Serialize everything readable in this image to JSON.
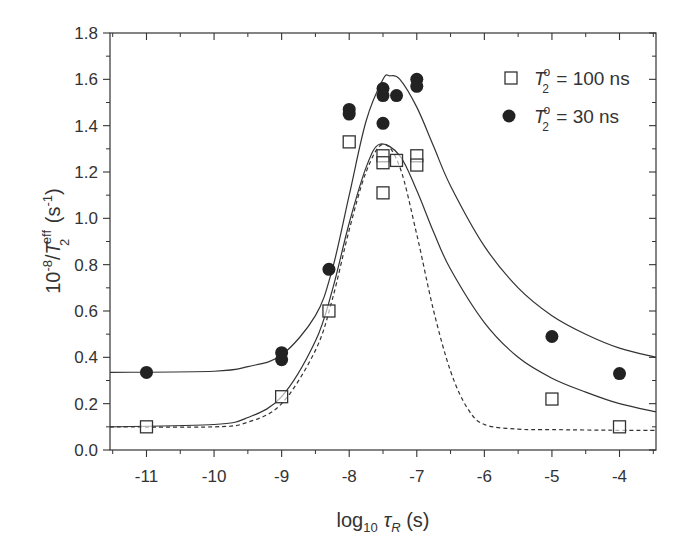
{
  "chart_data": {
    "type": "scatter",
    "title": "",
    "xlabel": "log10 τR (s)",
    "ylabel": "10^-8/T2^eff (s^-1)",
    "xlim": [
      -11.54,
      -3.46
    ],
    "ylim": [
      0.0,
      1.8
    ],
    "x_ticks": [
      -11,
      -10,
      -9,
      -8,
      -7,
      -6,
      -5,
      -4
    ],
    "y_ticks": [
      0.0,
      0.2,
      0.4,
      0.6,
      0.8,
      1.0,
      1.2,
      1.4,
      1.6,
      1.8
    ],
    "grid": false,
    "legend_position": "upper right",
    "series": [
      {
        "name": "T2° = 100 ns",
        "marker": "open-square",
        "points": [
          [
            -11,
            0.1
          ],
          [
            -9,
            0.23
          ],
          [
            -8.3,
            0.6
          ],
          [
            -8,
            1.33
          ],
          [
            -7.5,
            1.27
          ],
          [
            -7.5,
            1.24
          ],
          [
            -7.5,
            1.11
          ],
          [
            -7.3,
            1.25
          ],
          [
            -7,
            1.27
          ],
          [
            -7,
            1.23
          ],
          [
            -5,
            0.22
          ],
          [
            -4,
            0.1
          ]
        ]
      },
      {
        "name": "T2° = 30 ns",
        "marker": "filled-circle",
        "points": [
          [
            -11,
            0.335
          ],
          [
            -9,
            0.42
          ],
          [
            -9,
            0.39
          ],
          [
            -8.3,
            0.78
          ],
          [
            -8,
            1.47
          ],
          [
            -8,
            1.45
          ],
          [
            -7.5,
            1.56
          ],
          [
            -7.5,
            1.53
          ],
          [
            -7.5,
            1.41
          ],
          [
            -7.3,
            1.53
          ],
          [
            -7,
            1.6
          ],
          [
            -7,
            1.57
          ],
          [
            -5,
            0.49
          ],
          [
            -4,
            0.33
          ]
        ]
      }
    ],
    "curves": [
      {
        "name": "fit-30ns",
        "style": "solid",
        "baseline": 0.335,
        "peak": 1.615,
        "peak_x": -7.4,
        "x": [
          -11.54,
          -10,
          -9.5,
          -9,
          -8.5,
          -8.25,
          -8,
          -7.75,
          -7.5,
          -7.4,
          -7.25,
          -7,
          -6.75,
          -6.5,
          -6,
          -5.5,
          -5,
          -4.5,
          -4,
          -3.46
        ],
        "y": [
          0.335,
          0.34,
          0.36,
          0.41,
          0.58,
          0.78,
          1.1,
          1.42,
          1.6,
          1.615,
          1.6,
          1.48,
          1.31,
          1.14,
          0.88,
          0.7,
          0.58,
          0.5,
          0.44,
          0.4
        ]
      },
      {
        "name": "fit-100ns",
        "style": "solid",
        "baseline": 0.1,
        "peak": 1.32,
        "peak_x": -7.55,
        "x": [
          -11.54,
          -10,
          -9.5,
          -9,
          -8.5,
          -8.25,
          -8,
          -7.75,
          -7.55,
          -7.25,
          -7,
          -6.75,
          -6.5,
          -6,
          -5.5,
          -5,
          -4.5,
          -4,
          -3.46
        ],
        "y": [
          0.1,
          0.11,
          0.14,
          0.23,
          0.47,
          0.69,
          0.98,
          1.22,
          1.32,
          1.27,
          1.12,
          0.94,
          0.78,
          0.55,
          0.4,
          0.31,
          0.25,
          0.2,
          0.165
        ]
      },
      {
        "name": "fit-100ns-dashed",
        "style": "dashed",
        "baseline": 0.085,
        "peak": 1.32,
        "peak_x": -7.5,
        "x": [
          -11.54,
          -10,
          -9.5,
          -9,
          -8.5,
          -8.25,
          -8,
          -7.75,
          -7.5,
          -7.25,
          -7,
          -6.75,
          -6.5,
          -6.25,
          -6,
          -5.5,
          -5,
          -4,
          -3.46
        ],
        "y": [
          0.1,
          0.1,
          0.12,
          0.2,
          0.43,
          0.65,
          0.95,
          1.2,
          1.32,
          1.22,
          0.93,
          0.6,
          0.34,
          0.18,
          0.11,
          0.09,
          0.088,
          0.085,
          0.085
        ]
      }
    ]
  },
  "axes": {
    "x_tick_labels": [
      "-11",
      "-10",
      "-9",
      "-8",
      "-7",
      "-6",
      "-5",
      "-4"
    ],
    "y_tick_labels": [
      "0.0",
      "0.2",
      "0.4",
      "0.6",
      "0.8",
      "1.0",
      "1.2",
      "1.4",
      "1.6",
      "1.8"
    ],
    "xlabel_main": "log",
    "xlabel_sub": "10",
    "xlabel_tau": "τ",
    "xlabel_tau_sub": "R",
    "xlabel_unit": " (s)",
    "ylabel_prefix": "10",
    "ylabel_exp": "-8",
    "ylabel_slash": "/",
    "ylabel_T": "T",
    "ylabel_T_sup": "eff",
    "ylabel_T_sub": "2",
    "ylabel_unit": " (s",
    "ylabel_unit_exp": "-1",
    "ylabel_unit_close": ")"
  },
  "legend": {
    "items": [
      {
        "T": "T",
        "sup": "o",
        "sub": "2",
        "rest": " = 100 ns"
      },
      {
        "T": "T",
        "sup": "o",
        "sub": "2",
        "rest": " = 30 ns"
      }
    ]
  },
  "colors": {
    "ink": "#333333",
    "marker_fill": "#222222",
    "background": "#ffffff"
  }
}
